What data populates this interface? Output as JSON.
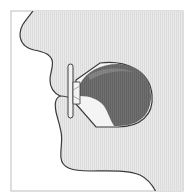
{
  "diagram": {
    "colors": {
      "background": "#ffffff",
      "frame": "#bdbdbd",
      "skin_fill": "#e6e6e6",
      "outline": "#3a3a3a",
      "cavity_fill": "#6e6e6e",
      "cavity_highlight": "#8a8a8a",
      "cavity_inner_light": "#f4f4f4",
      "mouthpiece_fill": "#f2f2f2"
    },
    "parts": [
      "face-profile",
      "mouthpiece",
      "oral-cavity"
    ]
  }
}
